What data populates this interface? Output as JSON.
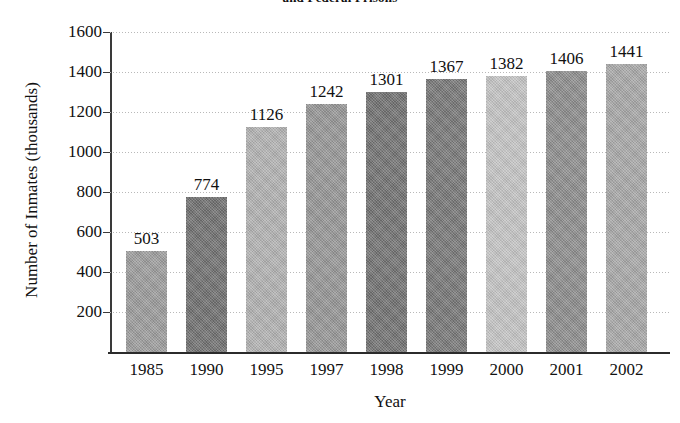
{
  "chart_data": {
    "type": "bar",
    "title": "and Federal Prisons",
    "xlabel": "Year",
    "ylabel": "Number of Inmates (thousands)",
    "categories": [
      "1985",
      "1990",
      "1995",
      "1997",
      "1998",
      "1999",
      "2000",
      "2001",
      "2002"
    ],
    "values": [
      503,
      774,
      1126,
      1242,
      1301,
      1367,
      1382,
      1406,
      1441
    ],
    "value_labels": [
      "503",
      "774",
      "1126",
      "1242",
      "1301",
      "1367",
      "1382",
      "1406",
      "1441"
    ],
    "bar_colors": [
      "#9a9a9a",
      "#6e6e6e",
      "#b0b0b0",
      "#949494",
      "#707070",
      "#767676",
      "#c2c2c2",
      "#8b8b8b",
      "#a6a6a6"
    ],
    "ylim": [
      0,
      1600
    ],
    "ytick_labels": [
      "1600",
      "1400",
      "1200",
      "1000",
      "800",
      "600",
      "400",
      "200"
    ],
    "ytick_values": [
      1600,
      1400,
      1200,
      1000,
      800,
      600,
      400,
      200
    ],
    "grid": "horizontal-dotted",
    "legend": "none"
  }
}
